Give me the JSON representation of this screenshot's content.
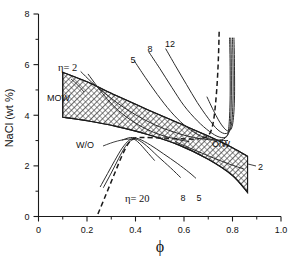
{
  "chart_data": {
    "type": "line",
    "title": "",
    "xlabel": "ϕ",
    "ylabel": "NaCl (wt %)",
    "xlim": [
      0,
      1.0
    ],
    "ylim": [
      0,
      8
    ],
    "grid": false,
    "legend_position": "inline-curve-labels",
    "x_ticks": [
      "0",
      "0.2",
      "0.4",
      "0.6",
      "0.8",
      "1.0"
    ],
    "x_tick_values": [
      0,
      0.2,
      0.4,
      0.6,
      0.8,
      1.0
    ],
    "x_minor_ticks": [
      0.1,
      0.3,
      0.5,
      0.7,
      0.9
    ],
    "y_ticks": [
      "0",
      "2",
      "4",
      "6",
      "8"
    ],
    "y_tick_values": [
      0,
      2,
      4,
      6,
      8
    ],
    "y_minor_ticks": [
      1,
      3,
      5,
      7
    ],
    "series": [
      {
        "name": "upper-branch-eta-2",
        "label": "η= 2",
        "style": "solid",
        "points": [
          [
            0.175,
            5.72
          ],
          [
            0.22,
            5.3
          ],
          [
            0.27,
            4.9
          ],
          [
            0.33,
            4.45
          ],
          [
            0.4,
            4.02
          ],
          [
            0.48,
            3.62
          ],
          [
            0.56,
            3.33
          ],
          [
            0.64,
            3.12
          ],
          [
            0.72,
            3.02
          ],
          [
            0.78,
            3.0
          ]
        ]
      },
      {
        "name": "upper-branch-5",
        "label": "5",
        "style": "solid",
        "points": [
          [
            0.395,
            6.15
          ],
          [
            0.44,
            5.5
          ],
          [
            0.49,
            4.82
          ],
          [
            0.545,
            4.15
          ],
          [
            0.6,
            3.62
          ],
          [
            0.655,
            3.25
          ],
          [
            0.7,
            3.08
          ],
          [
            0.745,
            3.02
          ],
          [
            0.775,
            3.15
          ],
          [
            0.785,
            3.55
          ],
          [
            0.79,
            4.6
          ],
          [
            0.79,
            6.1
          ],
          [
            0.788,
            7.05
          ]
        ]
      },
      {
        "name": "upper-branch-8",
        "label": "8",
        "style": "solid",
        "points": [
          [
            0.455,
            6.5
          ],
          [
            0.5,
            5.85
          ],
          [
            0.55,
            5.1
          ],
          [
            0.6,
            4.38
          ],
          [
            0.655,
            3.78
          ],
          [
            0.705,
            3.36
          ],
          [
            0.745,
            3.14
          ],
          [
            0.775,
            3.16
          ],
          [
            0.79,
            3.55
          ],
          [
            0.795,
            4.6
          ],
          [
            0.795,
            6.1
          ],
          [
            0.793,
            7.05
          ]
        ]
      },
      {
        "name": "upper-branch-12",
        "label": "12",
        "style": "solid",
        "points": [
          [
            0.525,
            6.62
          ],
          [
            0.565,
            5.95
          ],
          [
            0.61,
            5.22
          ],
          [
            0.655,
            4.5
          ],
          [
            0.7,
            3.88
          ],
          [
            0.74,
            3.42
          ],
          [
            0.775,
            3.28
          ],
          [
            0.795,
            3.6
          ],
          [
            0.802,
            4.6
          ],
          [
            0.802,
            6.1
          ],
          [
            0.8,
            7.05
          ]
        ]
      },
      {
        "name": "upper-branch-extra",
        "label": "",
        "style": "solid",
        "points": [
          [
            0.695,
            4.72
          ],
          [
            0.725,
            4.12
          ],
          [
            0.755,
            3.62
          ],
          [
            0.782,
            3.38
          ],
          [
            0.8,
            3.62
          ],
          [
            0.808,
            4.6
          ],
          [
            0.808,
            6.1
          ],
          [
            0.806,
            7.05
          ]
        ]
      },
      {
        "name": "upper-dashed-boundary",
        "label": "",
        "style": "dashed",
        "points": [
          [
            0.745,
            7.3
          ],
          [
            0.742,
            6.3
          ],
          [
            0.737,
            5.3
          ],
          [
            0.73,
            4.45
          ],
          [
            0.722,
            3.8
          ],
          [
            0.71,
            3.35
          ],
          [
            0.69,
            3.13
          ],
          [
            0.655,
            3.06
          ]
        ]
      },
      {
        "name": "lower-branch-eta-20",
        "label": "η= 20",
        "style": "solid",
        "points": [
          [
            0.255,
            1.18
          ],
          [
            0.285,
            1.7
          ],
          [
            0.315,
            2.22
          ],
          [
            0.345,
            2.7
          ],
          [
            0.372,
            3.0
          ],
          [
            0.392,
            3.06
          ],
          [
            0.415,
            2.9
          ],
          [
            0.445,
            2.58
          ],
          [
            0.478,
            2.22
          ]
        ]
      },
      {
        "name": "lower-branch-8",
        "label": "8",
        "style": "solid",
        "points": [
          [
            0.268,
            1.15
          ],
          [
            0.3,
            1.72
          ],
          [
            0.33,
            2.28
          ],
          [
            0.358,
            2.76
          ],
          [
            0.385,
            3.02
          ],
          [
            0.408,
            3.04
          ],
          [
            0.445,
            2.8
          ],
          [
            0.492,
            2.38
          ],
          [
            0.545,
            1.92
          ],
          [
            0.585,
            1.55
          ]
        ]
      },
      {
        "name": "lower-branch-5",
        "label": "5",
        "style": "solid",
        "points": [
          [
            0.345,
            3.02
          ],
          [
            0.38,
            3.12
          ],
          [
            0.415,
            3.06
          ],
          [
            0.462,
            2.82
          ],
          [
            0.515,
            2.48
          ],
          [
            0.572,
            2.1
          ],
          [
            0.62,
            1.75
          ],
          [
            0.648,
            1.52
          ]
        ]
      },
      {
        "name": "lower-dashed-boundary",
        "label": "",
        "style": "dashed",
        "points": [
          [
            0.245,
            0.1
          ],
          [
            0.272,
            0.72
          ],
          [
            0.302,
            1.42
          ],
          [
            0.33,
            2.08
          ],
          [
            0.355,
            2.62
          ],
          [
            0.378,
            2.98
          ],
          [
            0.4,
            3.1
          ],
          [
            0.44,
            3.12
          ],
          [
            0.51,
            3.1
          ],
          [
            0.59,
            3.07
          ],
          [
            0.655,
            3.05
          ]
        ]
      },
      {
        "name": "band-upper-inner-curve",
        "label": "",
        "style": "solid",
        "points": [
          [
            0.205,
            5.62
          ],
          [
            0.245,
            5.1
          ],
          [
            0.285,
            4.62
          ],
          [
            0.33,
            4.18
          ],
          [
            0.385,
            3.78
          ],
          [
            0.445,
            3.45
          ],
          [
            0.505,
            3.22
          ],
          [
            0.565,
            3.06
          ],
          [
            0.62,
            2.96
          ]
        ]
      },
      {
        "name": "band-lower-inner-curve",
        "label": "",
        "style": "solid",
        "points": [
          [
            0.565,
            2.95
          ],
          [
            0.62,
            2.72
          ],
          [
            0.675,
            2.5
          ],
          [
            0.73,
            2.28
          ],
          [
            0.79,
            2.06
          ],
          [
            0.845,
            1.88
          ]
        ]
      }
    ],
    "bands": [
      {
        "name": "MOW-two-phase-band",
        "label": "MOW",
        "hatched": true,
        "top_edge": [
          [
            0.1,
            5.7
          ],
          [
            0.2,
            5.32
          ],
          [
            0.32,
            4.78
          ],
          [
            0.45,
            4.22
          ],
          [
            0.58,
            3.68
          ],
          [
            0.7,
            3.18
          ],
          [
            0.8,
            2.72
          ],
          [
            0.862,
            2.38
          ]
        ],
        "bottom_edge": [
          [
            0.1,
            3.92
          ],
          [
            0.2,
            3.78
          ],
          [
            0.32,
            3.56
          ],
          [
            0.45,
            3.24
          ],
          [
            0.58,
            2.82
          ],
          [
            0.7,
            2.26
          ],
          [
            0.8,
            1.62
          ],
          [
            0.862,
            0.95
          ]
        ]
      }
    ],
    "annotations": [
      {
        "name": "eta-2-upper",
        "text": "η= 2",
        "x": 0.165,
        "y": 6.02
      },
      {
        "name": "label-5-upper",
        "text": "5",
        "x": 0.395,
        "y": 6.42
      },
      {
        "name": "label-8-upper",
        "text": "8",
        "x": 0.462,
        "y": 6.82
      },
      {
        "name": "label-12-upper",
        "text": "12",
        "x": 0.528,
        "y": 6.98
      },
      {
        "name": "label-MOW",
        "text": "MOW",
        "x": 0.125,
        "y": 4.55
      },
      {
        "name": "label-WO",
        "text": "W/O",
        "x": 0.272,
        "y": 3.12
      },
      {
        "name": "label-OW",
        "text": "O/W",
        "x": 0.705,
        "y": 3.05
      },
      {
        "name": "label-2-right",
        "text": "2",
        "x": 0.885,
        "y": 1.92
      },
      {
        "name": "eta-20-lower",
        "text": "η= 20",
        "x": 0.395,
        "y": 0.82
      },
      {
        "name": "label-8-lower",
        "text": "8",
        "x": 0.592,
        "y": 0.85
      },
      {
        "name": "label-5-lower",
        "text": "5",
        "x": 0.655,
        "y": 0.85
      }
    ]
  },
  "axes": {
    "x_title": "ϕ",
    "y_title": "NaCl (wt %)"
  },
  "labels": {
    "eta_2_upper": "η= 2",
    "c5_upper": "5",
    "c8_upper": "8",
    "c12_upper": "12",
    "mow": "MOW",
    "wo": "W/O",
    "ow": "O/W",
    "c2_right": "2",
    "eta_20_lower": "η= 20",
    "c8_lower": "8",
    "c5_lower": "5"
  },
  "ticks": {
    "x": [
      "0",
      "0.2",
      "0.4",
      "0.6",
      "0.8",
      "1.0"
    ],
    "y": [
      "0",
      "2",
      "4",
      "6",
      "8"
    ]
  },
  "colors": {
    "background": "#ffffff",
    "axis": "#1a1a1a",
    "curve": "#2b2b2b",
    "hatch": "#4a4a4a"
  }
}
